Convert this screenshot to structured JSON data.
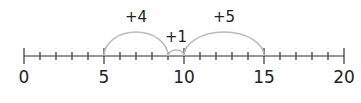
{
  "diagram": {
    "type": "number-line",
    "min": 0,
    "max": 20,
    "minor_step": 1,
    "major_step": 5,
    "labels": [
      {
        "value": 0,
        "text": "0"
      },
      {
        "value": 5,
        "text": "5"
      },
      {
        "value": 10,
        "text": "10"
      },
      {
        "value": 15,
        "text": "15"
      },
      {
        "value": 20,
        "text": "20"
      }
    ],
    "jumps": [
      {
        "from": 5,
        "to": 9,
        "label": "+4"
      },
      {
        "from": 9,
        "to": 10,
        "label": "+1"
      },
      {
        "from": 10,
        "to": 15,
        "label": "+5"
      }
    ],
    "colors": {
      "axis": "#333333",
      "arc": "#bbbbbb",
      "text": "#222222"
    }
  }
}
